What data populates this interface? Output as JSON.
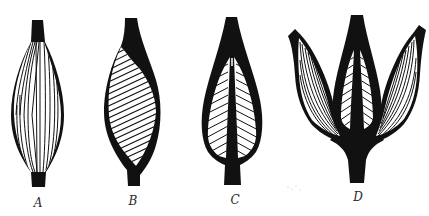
{
  "figure": {
    "ink_color": "#111111",
    "background": "#ffffff",
    "panels": [
      {
        "id": "A",
        "label": "A",
        "type": "fusiform",
        "cx": 38,
        "label_x": 38,
        "label_y": 196
      },
      {
        "id": "B",
        "label": "B",
        "type": "unipennate",
        "cx": 132,
        "label_x": 133,
        "label_y": 194
      },
      {
        "id": "C",
        "label": "C",
        "type": "bipennate",
        "cx": 232,
        "label_x": 235,
        "label_y": 193
      },
      {
        "id": "D",
        "label": "D",
        "type": "multipennate",
        "cx": 357,
        "label_x": 358,
        "label_y": 190
      }
    ]
  }
}
